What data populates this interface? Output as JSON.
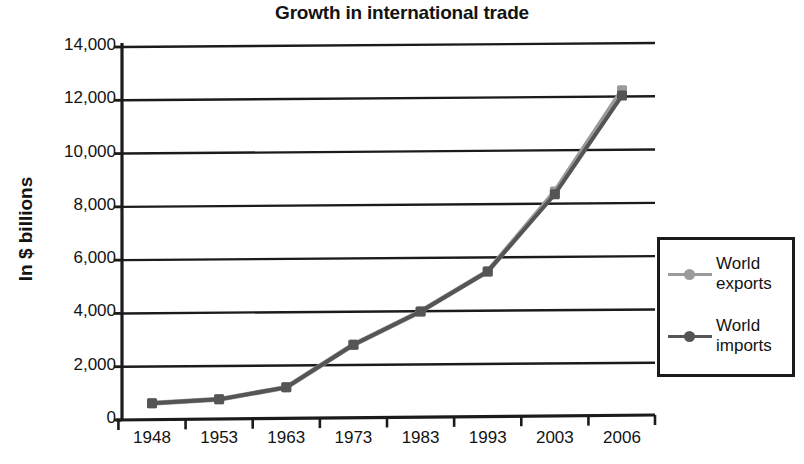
{
  "chart_data": {
    "type": "line",
    "title": "Growth in international trade",
    "xlabel": "",
    "ylabel": "In $ billions",
    "categories": [
      "1948",
      "1953",
      "1963",
      "1973",
      "1983",
      "1993",
      "2003",
      "2006"
    ],
    "series": [
      {
        "name": "World exports",
        "color": "#9b9b9b",
        "values": [
          550,
          700,
          1150,
          2750,
          4000,
          5500,
          8500,
          12300
        ]
      },
      {
        "name": "World imports",
        "color": "#555555",
        "values": [
          550,
          700,
          1150,
          2750,
          4000,
          5500,
          8400,
          12100
        ]
      }
    ],
    "ylim": [
      0,
      14000
    ],
    "ytick_labels": [
      "0",
      "2,000",
      "4,000",
      "6,000",
      "8,000",
      "10,000",
      "12,000",
      "14,000"
    ],
    "ytick_values": [
      0,
      2000,
      4000,
      6000,
      8000,
      10000,
      12000,
      14000
    ],
    "grid": true,
    "legend_position": "right"
  },
  "legend": {
    "entries": [
      {
        "label": "World exports",
        "line1": "World",
        "line2": "exports"
      },
      {
        "label": "World imports",
        "line1": "World",
        "line2": "imports"
      }
    ]
  },
  "axis_colors": {
    "axis": "#1b1b1b",
    "grid": "#1b1b1b"
  }
}
